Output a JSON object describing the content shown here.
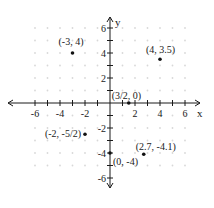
{
  "chart_data": {
    "type": "scatter",
    "title": "",
    "xlabel": "x",
    "ylabel": "y",
    "xlim": [
      -7,
      7
    ],
    "ylim": [
      -7,
      7
    ],
    "grid": "dotted",
    "x_ticks": [
      -6,
      -5,
      -4,
      -3,
      -2,
      -1,
      1,
      2,
      3,
      4,
      5,
      6
    ],
    "x_tick_labels": [
      {
        "value": -6,
        "label": "-6"
      },
      {
        "value": -4,
        "label": "-4"
      },
      {
        "value": -2,
        "label": "-2"
      },
      {
        "value": 2,
        "label": "2"
      },
      {
        "value": 4,
        "label": "4"
      },
      {
        "value": 6,
        "label": "6"
      }
    ],
    "y_ticks": [
      -6,
      -5,
      -4,
      -3,
      -2,
      -1,
      1,
      2,
      3,
      4,
      5,
      6
    ],
    "y_tick_labels": [
      {
        "value": 6,
        "label": "6"
      },
      {
        "value": 4,
        "label": "4"
      },
      {
        "value": 2,
        "label": "2"
      },
      {
        "value": -2,
        "label": "-2"
      },
      {
        "value": -4,
        "label": "-4"
      },
      {
        "value": -6,
        "label": "-6"
      }
    ],
    "points": [
      {
        "x": -3,
        "y": 4,
        "label": "(-3, 4)"
      },
      {
        "x": 4,
        "y": 3.5,
        "label": "(4, 3.5)"
      },
      {
        "x": 1.5,
        "y": 0,
        "label": "(3/2, 0)"
      },
      {
        "x": -2,
        "y": -2.5,
        "label": "(-2, -5/2)"
      },
      {
        "x": 0,
        "y": -4,
        "label": "(0, -4)"
      },
      {
        "x": 2.7,
        "y": -4.1,
        "label": "(2.7, -4.1)"
      }
    ]
  },
  "colors": {
    "axis": "#1a1a1a",
    "grid_dot": "#d8d8d8",
    "point": "#111111"
  }
}
